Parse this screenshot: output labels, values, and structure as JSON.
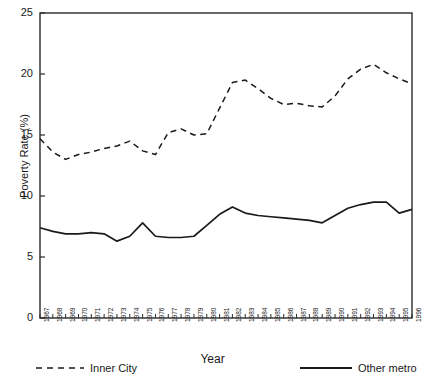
{
  "chart_data": {
    "type": "line",
    "title": "",
    "xlabel": "Year",
    "ylabel": "Poverty Rate (%)",
    "xlim": [
      1967,
      1996
    ],
    "ylim": [
      0,
      25
    ],
    "yticks": [
      0,
      5,
      10,
      15,
      20,
      25
    ],
    "grid": false,
    "legend_position": "bottom",
    "x": [
      1967,
      1968,
      1969,
      1970,
      1971,
      1972,
      1973,
      1974,
      1975,
      1976,
      1977,
      1978,
      1979,
      1980,
      1981,
      1982,
      1983,
      1984,
      1985,
      1986,
      1987,
      1988,
      1989,
      1990,
      1991,
      1992,
      1993,
      1994,
      1995,
      1996
    ],
    "categories": [
      "1967",
      "1968",
      "1969",
      "1970",
      "1971",
      "1972",
      "1973",
      "1974",
      "1975",
      "1976",
      "1977",
      "1978",
      "1979",
      "1980",
      "1981",
      "1982",
      "1983",
      "1984",
      "1985",
      "1986",
      "1987",
      "1988",
      "1989",
      "1990",
      "1991",
      "1992",
      "1993",
      "1994",
      "1995",
      "1996"
    ],
    "series": [
      {
        "name": "Inner City",
        "style": "dashed",
        "color": "#1a1a1a",
        "values": [
          14.7,
          13.6,
          13.0,
          13.4,
          13.6,
          13.9,
          14.1,
          14.5,
          13.7,
          13.4,
          15.2,
          15.5,
          15.0,
          15.1,
          17.2,
          19.3,
          19.5,
          18.8,
          18.0,
          17.5,
          17.6,
          17.4,
          17.3,
          18.2,
          19.6,
          20.4,
          20.8,
          20.1,
          19.6,
          19.2
        ]
      },
      {
        "name": "Other metro",
        "style": "solid",
        "color": "#1a1a1a",
        "values": [
          7.4,
          7.1,
          6.9,
          6.9,
          7.0,
          6.9,
          6.3,
          6.7,
          7.8,
          6.7,
          6.6,
          6.6,
          6.7,
          7.6,
          8.5,
          9.1,
          8.6,
          8.4,
          8.3,
          8.2,
          8.1,
          8.0,
          7.8,
          8.4,
          9.0,
          9.3,
          9.5,
          9.5,
          8.6,
          8.9
        ]
      }
    ]
  },
  "legend": {
    "items": [
      {
        "label": "Inner City",
        "style": "dashed"
      },
      {
        "label": "Other metro",
        "style": "solid"
      }
    ]
  },
  "axes": {
    "y_title": "Poverty Rate (%)",
    "x_title": "Year"
  }
}
